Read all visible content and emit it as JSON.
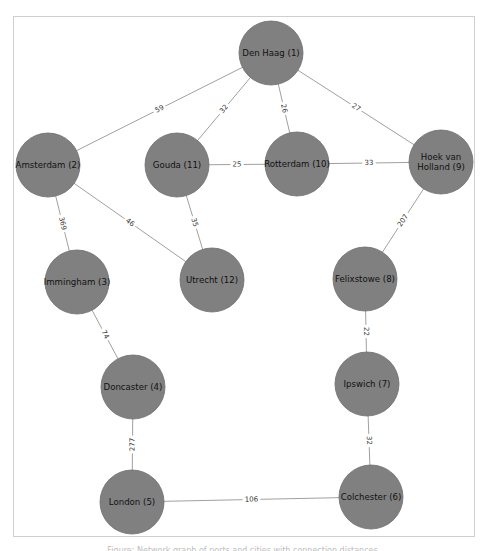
{
  "diagram": {
    "type": "network-graph",
    "node_fill": "#808080",
    "node_stroke": "#6e6e6e",
    "edge_color": "#a0a0a0",
    "nodes": [
      {
        "id": 1,
        "label": "Den Haag (1)",
        "lines": [
          "Den Haag (1)"
        ],
        "x": 271,
        "y": 53
      },
      {
        "id": 2,
        "label": "Amsterdam (2)",
        "lines": [
          "Amsterdam (2)"
        ],
        "x": 48,
        "y": 165
      },
      {
        "id": 3,
        "label": "Immingham (3)",
        "lines": [
          "Immingham (3)"
        ],
        "x": 77,
        "y": 282
      },
      {
        "id": 4,
        "label": "Doncaster (4)",
        "lines": [
          "Doncaster (4)"
        ],
        "x": 133,
        "y": 387
      },
      {
        "id": 5,
        "label": "London (5)",
        "lines": [
          "London (5)"
        ],
        "x": 132,
        "y": 502
      },
      {
        "id": 6,
        "label": "Colchester (6)",
        "lines": [
          "Colchester (6)"
        ],
        "x": 371,
        "y": 497
      },
      {
        "id": 7,
        "label": "Ipswich (7)",
        "lines": [
          "Ipswich (7)"
        ],
        "x": 367,
        "y": 384
      },
      {
        "id": 8,
        "label": "Felixstowe (8)",
        "lines": [
          "Felixstowe (8)"
        ],
        "x": 365,
        "y": 279
      },
      {
        "id": 9,
        "label": "Hoek van Holland (9)",
        "lines": [
          "Hoek van",
          "Holland (9)"
        ],
        "x": 441,
        "y": 162
      },
      {
        "id": 10,
        "label": "Rotterdam (10)",
        "lines": [
          "Rotterdam (10)"
        ],
        "x": 297,
        "y": 164
      },
      {
        "id": 11,
        "label": "Gouda (11)",
        "lines": [
          "Gouda (11)"
        ],
        "x": 177,
        "y": 165
      },
      {
        "id": 12,
        "label": "Utrecht (12)",
        "lines": [
          "Utrecht (12)"
        ],
        "x": 212,
        "y": 280
      }
    ],
    "edges": [
      {
        "from": 1,
        "to": 2,
        "weight": "59"
      },
      {
        "from": 1,
        "to": 11,
        "weight": "32"
      },
      {
        "from": 1,
        "to": 10,
        "weight": "26"
      },
      {
        "from": 1,
        "to": 9,
        "weight": "27"
      },
      {
        "from": 11,
        "to": 10,
        "weight": "25"
      },
      {
        "from": 10,
        "to": 9,
        "weight": "33"
      },
      {
        "from": 2,
        "to": 3,
        "weight": "369"
      },
      {
        "from": 2,
        "to": 12,
        "weight": "46"
      },
      {
        "from": 11,
        "to": 12,
        "weight": "35"
      },
      {
        "from": 9,
        "to": 8,
        "weight": "207"
      },
      {
        "from": 3,
        "to": 4,
        "weight": "74"
      },
      {
        "from": 8,
        "to": 7,
        "weight": "22"
      },
      {
        "from": 4,
        "to": 5,
        "weight": "277"
      },
      {
        "from": 7,
        "to": 6,
        "weight": "32"
      },
      {
        "from": 5,
        "to": 6,
        "weight": "106"
      }
    ],
    "node_radius": 32
  },
  "caption": "Figure: Network graph of ports and cities with connection distances"
}
